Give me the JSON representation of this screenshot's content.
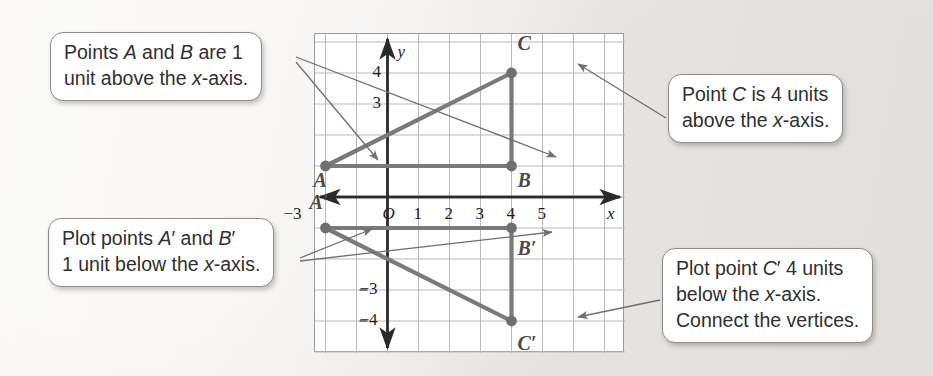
{
  "callouts": {
    "top_left": {
      "name": "points-ab-callout",
      "lines": [
        "Points A and B are 1",
        "unit above the x-axis."
      ]
    },
    "top_right": {
      "name": "point-c-callout",
      "lines": [
        "Point C is 4 units",
        "above the x-axis."
      ]
    },
    "bottom_left": {
      "name": "plot-a-prime-b-prime-callout",
      "lines": [
        "Plot points A′ and B′",
        "1 unit below the x-axis."
      ]
    },
    "bottom_right": {
      "name": "plot-c-prime-callout",
      "lines": [
        "Plot point C′ 4 units",
        "below the x-axis.",
        "Connect the vertices."
      ]
    }
  },
  "chart_data": {
    "type": "scatter",
    "title": "",
    "xlabel": "x",
    "ylabel": "y",
    "grid": true,
    "legend": "none",
    "xlim": [
      -4.3,
      5.7
    ],
    "ylim": [
      -5.5,
      5.2
    ],
    "x_ticks": [
      {
        "value": -3,
        "label": "−3"
      },
      {
        "value": 0,
        "label": "O"
      },
      {
        "value": 1,
        "label": "1"
      },
      {
        "value": 2,
        "label": "2"
      },
      {
        "value": 3,
        "label": "3"
      },
      {
        "value": 4,
        "label": "4"
      },
      {
        "value": 5,
        "label": "5"
      }
    ],
    "y_ticks": [
      {
        "value": 4,
        "label": "4"
      },
      {
        "value": 3,
        "label": "3"
      },
      {
        "value": -3,
        "label": "−3"
      },
      {
        "value": -4,
        "label": "−4"
      }
    ],
    "points": [
      {
        "label": "A",
        "x": -2,
        "y": 1,
        "label_dx": -12,
        "label_dy": 14
      },
      {
        "label": "B",
        "x": 4,
        "y": 1,
        "label_dx": 6,
        "label_dy": 14
      },
      {
        "label": "C",
        "x": 4,
        "y": 4,
        "label_dx": 6,
        "label_dy": -30
      },
      {
        "label": "A′",
        "x": -2,
        "y": -1,
        "label_dx": -16,
        "label_dy": -26
      },
      {
        "label": "B′",
        "x": 4,
        "y": -1,
        "label_dx": 6,
        "label_dy": 20
      },
      {
        "label": "C′",
        "x": 4,
        "y": -4,
        "label_dx": 6,
        "label_dy": 22
      }
    ],
    "polygons": [
      {
        "name": "triangle-ABC",
        "vertices": [
          "A",
          "B",
          "C"
        ]
      },
      {
        "name": "triangle-A'B'C'",
        "vertices": [
          "A′",
          "B′",
          "C′"
        ]
      }
    ],
    "colors": {
      "triangle": "#7a7a7a",
      "grid": "#b9b9b9",
      "axis": "#2b2b2b",
      "point": "#6f6f6f",
      "leader": "#6f6f6f"
    },
    "units_per_cell": 1
  }
}
